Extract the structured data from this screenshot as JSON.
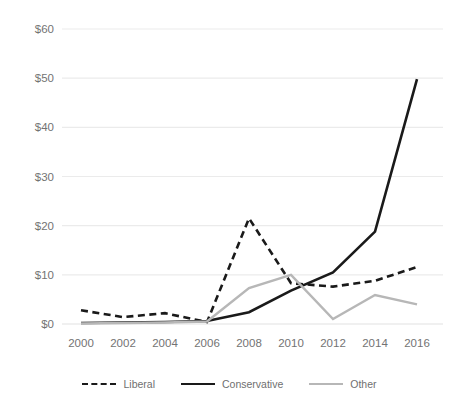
{
  "chart_data": {
    "type": "line",
    "title": "",
    "xlabel": "",
    "ylabel": "",
    "x": [
      2000,
      2002,
      2004,
      2006,
      2008,
      2010,
      2012,
      2014,
      2016
    ],
    "categories": [
      "2000",
      "2002",
      "2004",
      "2006",
      "2008",
      "2010",
      "2012",
      "2014",
      "2016"
    ],
    "ylim": [
      0,
      60
    ],
    "yticks": [
      0,
      10,
      20,
      30,
      40,
      50,
      60
    ],
    "ytick_labels": [
      "$0",
      "$10",
      "$20",
      "$30",
      "$40",
      "$50",
      "$60"
    ],
    "grid": "horizontal",
    "legend_position": "bottom",
    "series": [
      {
        "name": "Liberal",
        "style": "dashed",
        "color": "#1a1a1a",
        "values": [
          2.8,
          1.4,
          2.2,
          0.4,
          21.5,
          8.3,
          7.6,
          8.8,
          11.6
        ]
      },
      {
        "name": "Conservative",
        "style": "solid",
        "color": "#1a1a1a",
        "values": [
          0.2,
          0.3,
          0.4,
          0.6,
          2.4,
          6.8,
          10.5,
          18.8,
          49.8
        ]
      },
      {
        "name": "Other",
        "style": "solid",
        "color": "#b7b7b7",
        "values": [
          0.1,
          0.2,
          0.3,
          0.5,
          7.3,
          10.0,
          1.0,
          5.9,
          4.0
        ]
      }
    ]
  },
  "legend": {
    "items": [
      {
        "label": "Liberal",
        "swatch": "dashed-line-black"
      },
      {
        "label": "Conservative",
        "swatch": "solid-line-black"
      },
      {
        "label": "Other",
        "swatch": "solid-line-gray"
      }
    ]
  },
  "axes": {
    "y_tick_labels": [
      "$60",
      "$50",
      "$40",
      "$30",
      "$20",
      "$10",
      "$0"
    ],
    "x_tick_labels": [
      "2000",
      "2002",
      "2004",
      "2006",
      "2008",
      "2010",
      "2012",
      "2014",
      "2016"
    ]
  },
  "colors": {
    "gridline": "#ebebeb",
    "dark_series": "#1a1a1a",
    "light_series": "#b7b7b7",
    "tick_text": "#737373",
    "background": "#ffffff"
  }
}
